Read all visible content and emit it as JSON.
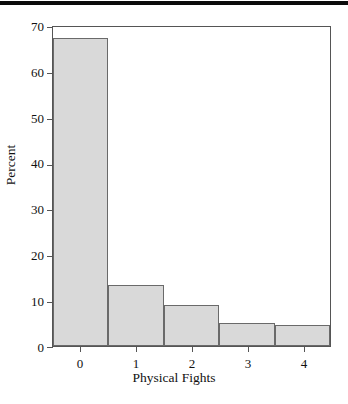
{
  "chart_data": {
    "type": "bar",
    "title": "",
    "subtitle": "",
    "xlabel": "Physical Fights",
    "ylabel": "Percent",
    "categories": [
      "0",
      "1",
      "2",
      "3",
      "4"
    ],
    "values": [
      67.5,
      13.5,
      9.0,
      5.0,
      4.7
    ],
    "series": [
      {
        "name": "Percent",
        "values": [
          67.5,
          13.5,
          9.0,
          5.0,
          4.7
        ]
      }
    ],
    "xlim": [
      -0.5,
      4.5
    ],
    "ylim": [
      0,
      70
    ],
    "ytick_labels": [
      "0",
      "10",
      "20",
      "30",
      "40",
      "50",
      "60",
      "70"
    ],
    "ytick_values": [
      0,
      10,
      20,
      30,
      40,
      50,
      60,
      70
    ],
    "xtick_labels": [
      "0",
      "1",
      "2",
      "3",
      "4"
    ],
    "xtick_values": [
      0,
      1,
      2,
      3,
      4
    ],
    "bin_edges": [
      -0.5,
      0.5,
      1.5,
      2.5,
      3.5,
      4.5
    ],
    "grid": false,
    "legend": false,
    "legend_position": "none",
    "bar_fill_color": "#d9d9d9",
    "bar_edge_color": "#6a6a6a",
    "axis_color": "#555555",
    "background_color": "#ffffff",
    "text_color": "#111111",
    "annotations": []
  },
  "axes": {
    "y_ticks": [
      {
        "label": "70",
        "value": 70
      },
      {
        "label": "60",
        "value": 60
      },
      {
        "label": "50",
        "value": 50
      },
      {
        "label": "40",
        "value": 40
      },
      {
        "label": "30",
        "value": 30
      },
      {
        "label": "20",
        "value": 20
      },
      {
        "label": "10",
        "value": 10
      },
      {
        "label": "0",
        "value": 0
      }
    ],
    "x_ticks": [
      {
        "label": "0",
        "value": 0
      },
      {
        "label": "1",
        "value": 1
      },
      {
        "label": "2",
        "value": 2
      },
      {
        "label": "3",
        "value": 3
      },
      {
        "label": "4",
        "value": 4
      }
    ],
    "x_title": "Physical Fights",
    "y_title": "Percent"
  }
}
